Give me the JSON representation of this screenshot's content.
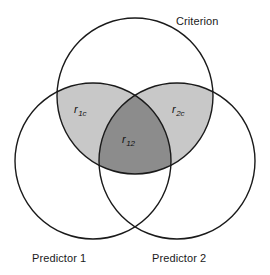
{
  "figure": {
    "type": "venn-diagram",
    "background_color": "#ffffff",
    "stroke_color": "#1a1a1a",
    "stroke_width": 1.4
  },
  "circles": [
    {
      "name": "criterion",
      "label": "Criterion",
      "cx": 135,
      "cy": 96,
      "r": 78,
      "fill": "none"
    },
    {
      "name": "predictor-1",
      "label": "Predictor 1",
      "cx": 93,
      "cy": 161,
      "r": 78,
      "fill": "none"
    },
    {
      "name": "predictor-2",
      "label": "Predictor 2",
      "cx": 177,
      "cy": 161,
      "r": 78,
      "fill": "none"
    }
  ],
  "regions": [
    {
      "name": "criterion-predictor1-overlap",
      "symbol": "r",
      "subscript": "1c",
      "fill": "#c8c8c8",
      "description": "Criterion and Predictor 1 shared variance"
    },
    {
      "name": "criterion-predictor2-overlap",
      "symbol": "r",
      "subscript": "2c",
      "fill": "#c8c8c8",
      "description": "Criterion and Predictor 2 shared variance"
    },
    {
      "name": "triple-overlap",
      "symbol": "r",
      "subscript": "12",
      "fill": "#8c8c8c",
      "description": "Predictor 1 and Predictor 2 shared variance with Criterion"
    }
  ],
  "labels": {
    "criterion": "Criterion",
    "predictor_1": "Predictor 1",
    "predictor_2": "Predictor 2",
    "r1c_symbol": "r",
    "r1c_subscript": "1c",
    "r2c_symbol": "r",
    "r2c_subscript": "2c",
    "r12_symbol": "r",
    "r12_subscript": "12"
  }
}
